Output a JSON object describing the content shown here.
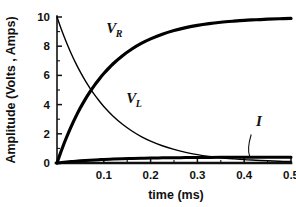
{
  "chart_data": {
    "type": "line",
    "title": "",
    "xlabel": "time (ms)",
    "ylabel": "Amplitude (Volts , Amps)",
    "xlim": [
      0,
      0.5
    ],
    "ylim": [
      0,
      10
    ],
    "xticks": [
      "0.1",
      "0.2",
      "0.3",
      "0.4",
      "0.5"
    ],
    "xtick_values": [
      0.1,
      0.2,
      0.3,
      0.4,
      0.5
    ],
    "yticks": [
      "0",
      "2",
      "4",
      "6",
      "8",
      "10"
    ],
    "ytick_values": [
      0,
      2,
      4,
      6,
      8,
      10
    ],
    "minor_yticks": [
      1,
      3,
      5,
      7,
      9
    ],
    "grid": false,
    "legend": "inline-annotations",
    "background": "#ffffff",
    "line_color": "#000000",
    "annotations": [
      {
        "name": "VR",
        "text": "V",
        "sub": "R",
        "x": 0.105,
        "y": 8.9
      },
      {
        "name": "VL",
        "text": "V",
        "sub": "L",
        "x": 0.148,
        "y": 4.1
      },
      {
        "name": "I",
        "text": "I",
        "sub": "",
        "x": 0.425,
        "y": 2.55
      }
    ],
    "series": [
      {
        "name": "VR",
        "label": "V_R",
        "linewidth": 3.2,
        "description": "Resistor voltage: rising exponential 10*(1-exp(-t/tau))",
        "tau": 0.105,
        "x": [
          0.0,
          0.01,
          0.02,
          0.03,
          0.04,
          0.05,
          0.06,
          0.07,
          0.08,
          0.09,
          0.1,
          0.12,
          0.14,
          0.16,
          0.18,
          0.2,
          0.225,
          0.25,
          0.275,
          0.3,
          0.325,
          0.35,
          0.375,
          0.4,
          0.425,
          0.45,
          0.475,
          0.5
        ],
        "y": [
          0.0,
          0.91,
          1.73,
          2.48,
          3.16,
          3.78,
          4.34,
          4.85,
          5.32,
          5.74,
          6.13,
          6.8,
          7.35,
          7.81,
          8.19,
          8.5,
          8.82,
          9.07,
          9.27,
          9.43,
          9.55,
          9.64,
          9.71,
          9.77,
          9.81,
          9.85,
          9.88,
          9.9
        ]
      },
      {
        "name": "VL",
        "label": "V_L",
        "linewidth": 1.4,
        "description": "Inductor voltage: decaying exponential 10*exp(-t/tau)",
        "tau": 0.105,
        "x": [
          0.0,
          0.01,
          0.02,
          0.03,
          0.04,
          0.05,
          0.06,
          0.07,
          0.08,
          0.09,
          0.1,
          0.12,
          0.14,
          0.16,
          0.18,
          0.2,
          0.225,
          0.25,
          0.275,
          0.3,
          0.325,
          0.35,
          0.375,
          0.4,
          0.425,
          0.45,
          0.475,
          0.5
        ],
        "y": [
          10.0,
          9.09,
          8.27,
          7.52,
          6.84,
          6.22,
          5.66,
          5.15,
          4.68,
          4.26,
          3.87,
          3.2,
          2.65,
          2.19,
          1.81,
          1.5,
          1.18,
          0.93,
          0.73,
          0.57,
          0.45,
          0.36,
          0.29,
          0.23,
          0.19,
          0.15,
          0.12,
          0.1
        ]
      },
      {
        "name": "I",
        "label": "I",
        "linewidth": 3.0,
        "description": "Current: rising exponential to ~0.4 A",
        "tau": 0.105,
        "x": [
          0.0,
          0.01,
          0.02,
          0.03,
          0.04,
          0.05,
          0.06,
          0.07,
          0.08,
          0.09,
          0.1,
          0.12,
          0.14,
          0.16,
          0.18,
          0.2,
          0.225,
          0.25,
          0.275,
          0.3,
          0.325,
          0.35,
          0.375,
          0.4,
          0.425,
          0.45,
          0.475,
          0.5
        ],
        "y": [
          0.0,
          0.036,
          0.069,
          0.099,
          0.126,
          0.151,
          0.174,
          0.194,
          0.213,
          0.23,
          0.245,
          0.272,
          0.294,
          0.312,
          0.328,
          0.34,
          0.353,
          0.363,
          0.371,
          0.377,
          0.382,
          0.386,
          0.388,
          0.391,
          0.392,
          0.394,
          0.395,
          0.396
        ]
      }
    ]
  }
}
